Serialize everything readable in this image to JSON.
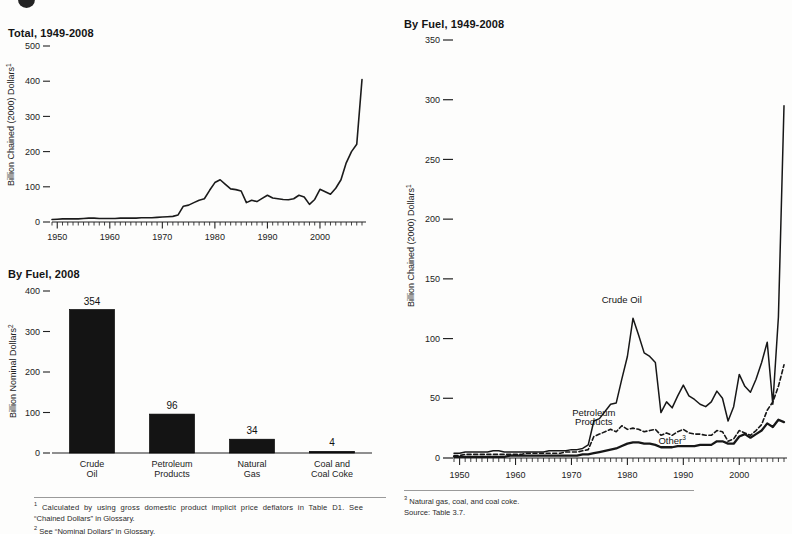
{
  "figure": {
    "marker": "bullet-mark"
  },
  "panels": {
    "total": {
      "title": "Total, 1949-2008",
      "ylabel": "Billion Chained (2000) Dollars",
      "ylabel_sup": "1"
    },
    "by_fuel_2008": {
      "title": "By Fuel, 2008",
      "ylabel": "Billion Nominal Dollars",
      "ylabel_sup": "2"
    },
    "by_fuel_series": {
      "title": "By Fuel, 1949-2008",
      "ylabel": "Billion Chained (2000) Dollars",
      "ylabel_sup": "1"
    }
  },
  "footnotes_left": {
    "items": [
      {
        "sup": "1",
        "text": "Calculated by using gross domestic product implicit price deflators in Table D1.  See"
      },
      {
        "sup": "",
        "text": "“Chained Dollars” in Glossary."
      },
      {
        "sup": "2",
        "text": "See “Nominal Dollars” in Glossary."
      }
    ]
  },
  "footnotes_right": {
    "items": [
      {
        "sup": "3",
        "text": "Natural gas, coal, and coal coke."
      },
      {
        "sup": "",
        "text": "Source:  Table 3.7."
      }
    ]
  },
  "chart_data": [
    {
      "id": "total-line",
      "type": "line",
      "title": "Total, 1949-2008",
      "xlabel": "",
      "ylabel": "Billion Chained (2000) Dollars",
      "xlim": [
        1949,
        2008
      ],
      "ylim": [
        0,
        500
      ],
      "yticks": [
        0,
        100,
        200,
        300,
        400,
        500
      ],
      "xticks": [
        1950,
        1960,
        1970,
        1980,
        1990,
        2000
      ],
      "xtick_minor_step": 1,
      "grid": false,
      "legend": "none",
      "series": [
        {
          "name": "Total",
          "style": "solid",
          "x": [
            1949,
            1950,
            1951,
            1952,
            1953,
            1954,
            1955,
            1956,
            1957,
            1958,
            1959,
            1960,
            1961,
            1962,
            1963,
            1964,
            1965,
            1966,
            1967,
            1968,
            1969,
            1970,
            1971,
            1972,
            1973,
            1974,
            1975,
            1976,
            1977,
            1978,
            1979,
            1980,
            1981,
            1982,
            1983,
            1984,
            1985,
            1986,
            1987,
            1988,
            1989,
            1990,
            1991,
            1992,
            1993,
            1994,
            1995,
            1996,
            1997,
            1998,
            1999,
            2000,
            2001,
            2002,
            2003,
            2004,
            2005,
            2006,
            2007,
            2008
          ],
          "values": [
            7,
            8,
            9,
            9,
            9,
            9,
            10,
            11,
            11,
            10,
            10,
            10,
            10,
            11,
            11,
            11,
            11,
            12,
            12,
            12,
            13,
            14,
            15,
            16,
            20,
            45,
            48,
            55,
            62,
            66,
            90,
            112,
            120,
            107,
            94,
            92,
            88,
            55,
            62,
            58,
            67,
            76,
            68,
            66,
            64,
            63,
            66,
            76,
            71,
            50,
            64,
            93,
            86,
            79,
            96,
            120,
            168,
            200,
            221,
            405
          ]
        }
      ]
    },
    {
      "id": "by-fuel-2008-bar",
      "type": "bar",
      "title": "By Fuel, 2008",
      "xlabel": "",
      "ylabel": "Billion Nominal Dollars",
      "ylim": [
        0,
        400
      ],
      "yticks": [
        0,
        100,
        200,
        300,
        400
      ],
      "grid": false,
      "legend": "none",
      "categories": [
        "Crude Oil",
        "Petroleum Products",
        "Natural Gas",
        "Coal and Coal Coke"
      ],
      "category_lines": [
        [
          "Crude",
          "Oil"
        ],
        [
          "Petroleum",
          "Products"
        ],
        [
          "Natural",
          "Gas"
        ],
        [
          "Coal and",
          "Coal Coke"
        ]
      ],
      "values": [
        354,
        96,
        34,
        4
      ],
      "value_labels": [
        "354",
        "96",
        "34",
        "4"
      ],
      "bar_color": "#141414"
    },
    {
      "id": "by-fuel-series-line",
      "type": "line",
      "title": "By Fuel, 1949-2008",
      "xlabel": "",
      "ylabel": "Billion Chained (2000) Dollars",
      "xlim": [
        1949,
        2008
      ],
      "ylim": [
        0,
        350
      ],
      "yticks": [
        0,
        50,
        100,
        150,
        200,
        250,
        300,
        350
      ],
      "xticks": [
        1950,
        1960,
        1970,
        1980,
        1990,
        2000
      ],
      "xtick_minor_step": 1,
      "grid": false,
      "legend": "inline-annotations",
      "annotations": [
        {
          "text": "Crude Oil",
          "sup": "",
          "x": 1979,
          "y": 130
        },
        {
          "text": "Petroleum",
          "sup": "",
          "x": 1974,
          "y": 35
        },
        {
          "text": "Products",
          "sup": "",
          "x": 1974,
          "y": 28
        },
        {
          "text": "Other",
          "sup": "3",
          "x": 1988,
          "y": 12
        }
      ],
      "series": [
        {
          "name": "Crude Oil",
          "style": "solid",
          "x": [
            1949,
            1950,
            1951,
            1952,
            1953,
            1954,
            1955,
            1956,
            1957,
            1958,
            1959,
            1960,
            1961,
            1962,
            1963,
            1964,
            1965,
            1966,
            1967,
            1968,
            1969,
            1970,
            1971,
            1972,
            1973,
            1974,
            1975,
            1976,
            1977,
            1978,
            1979,
            1980,
            1981,
            1982,
            1983,
            1984,
            1985,
            1986,
            1987,
            1988,
            1989,
            1990,
            1991,
            1992,
            1993,
            1994,
            1995,
            1996,
            1997,
            1998,
            1999,
            2000,
            2001,
            2002,
            2003,
            2004,
            2005,
            2006,
            2007,
            2008
          ],
          "values": [
            4,
            4,
            5,
            5,
            5,
            5,
            5,
            6,
            6,
            5,
            5,
            5,
            5,
            5,
            5,
            5,
            5,
            6,
            6,
            6,
            6,
            7,
            7,
            8,
            11,
            31,
            33,
            39,
            45,
            46,
            66,
            85,
            117,
            103,
            88,
            85,
            80,
            38,
            47,
            42,
            52,
            61,
            52,
            49,
            45,
            43,
            47,
            56,
            50,
            31,
            43,
            70,
            60,
            55,
            66,
            80,
            97,
            45,
            118,
            295
          ]
        },
        {
          "name": "Petroleum Products",
          "style": "dashed",
          "x": [
            1949,
            1950,
            1951,
            1952,
            1953,
            1954,
            1955,
            1956,
            1957,
            1958,
            1959,
            1960,
            1961,
            1962,
            1963,
            1964,
            1965,
            1966,
            1967,
            1968,
            1969,
            1970,
            1971,
            1972,
            1973,
            1974,
            1975,
            1976,
            1977,
            1978,
            1979,
            1980,
            1981,
            1982,
            1983,
            1984,
            1985,
            1986,
            1987,
            1988,
            1989,
            1990,
            1991,
            1992,
            1993,
            1994,
            1995,
            1996,
            1997,
            1998,
            1999,
            2000,
            2001,
            2002,
            2003,
            2004,
            2005,
            2006,
            2007,
            2008
          ],
          "values": [
            2,
            2,
            3,
            3,
            3,
            3,
            3,
            3,
            3,
            3,
            3,
            3,
            3,
            4,
            4,
            4,
            4,
            4,
            4,
            4,
            5,
            5,
            5,
            6,
            7,
            18,
            20,
            22,
            24,
            22,
            27,
            24,
            25,
            24,
            22,
            23,
            24,
            19,
            21,
            19,
            22,
            24,
            21,
            20,
            20,
            19,
            19,
            23,
            22,
            14,
            16,
            23,
            21,
            19,
            23,
            28,
            40,
            47,
            60,
            78
          ]
        },
        {
          "name": "Other",
          "style": "solid-bold",
          "x": [
            1949,
            1950,
            1951,
            1952,
            1953,
            1954,
            1955,
            1956,
            1957,
            1958,
            1959,
            1960,
            1961,
            1962,
            1963,
            1964,
            1965,
            1966,
            1967,
            1968,
            1969,
            1970,
            1971,
            1972,
            1973,
            1974,
            1975,
            1976,
            1977,
            1978,
            1979,
            1980,
            1981,
            1982,
            1983,
            1984,
            1985,
            1986,
            1987,
            1988,
            1989,
            1990,
            1991,
            1992,
            1993,
            1994,
            1995,
            1996,
            1997,
            1998,
            1999,
            2000,
            2001,
            2002,
            2003,
            2004,
            2005,
            2006,
            2007,
            2008
          ],
          "values": [
            1,
            1,
            1,
            1,
            1,
            1,
            1,
            1,
            1,
            1,
            2,
            2,
            2,
            2,
            2,
            2,
            2,
            2,
            2,
            2,
            2,
            2,
            2,
            3,
            3,
            4,
            5,
            6,
            7,
            8,
            10,
            12,
            13,
            13,
            12,
            12,
            11,
            9,
            9,
            9,
            10,
            10,
            10,
            10,
            11,
            11,
            11,
            14,
            14,
            12,
            12,
            18,
            20,
            17,
            20,
            23,
            29,
            26,
            32,
            30
          ]
        }
      ]
    }
  ]
}
